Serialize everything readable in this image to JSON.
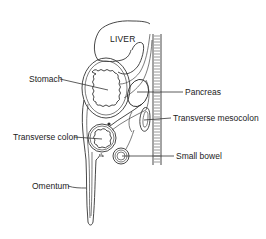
{
  "diagram": {
    "type": "anatomical sagittal section",
    "labels": {
      "liver": "LIVER",
      "stomach": "Stomach",
      "pancreas": "Pancreas",
      "transverse_mesocolon": "Transverse mesocolon",
      "transverse_colon": "Transverse colon",
      "small_bowel": "Small bowel",
      "omentum": "Omentum"
    },
    "colors": {
      "line": "#333333",
      "text": "#222222",
      "background": "#ffffff"
    }
  }
}
